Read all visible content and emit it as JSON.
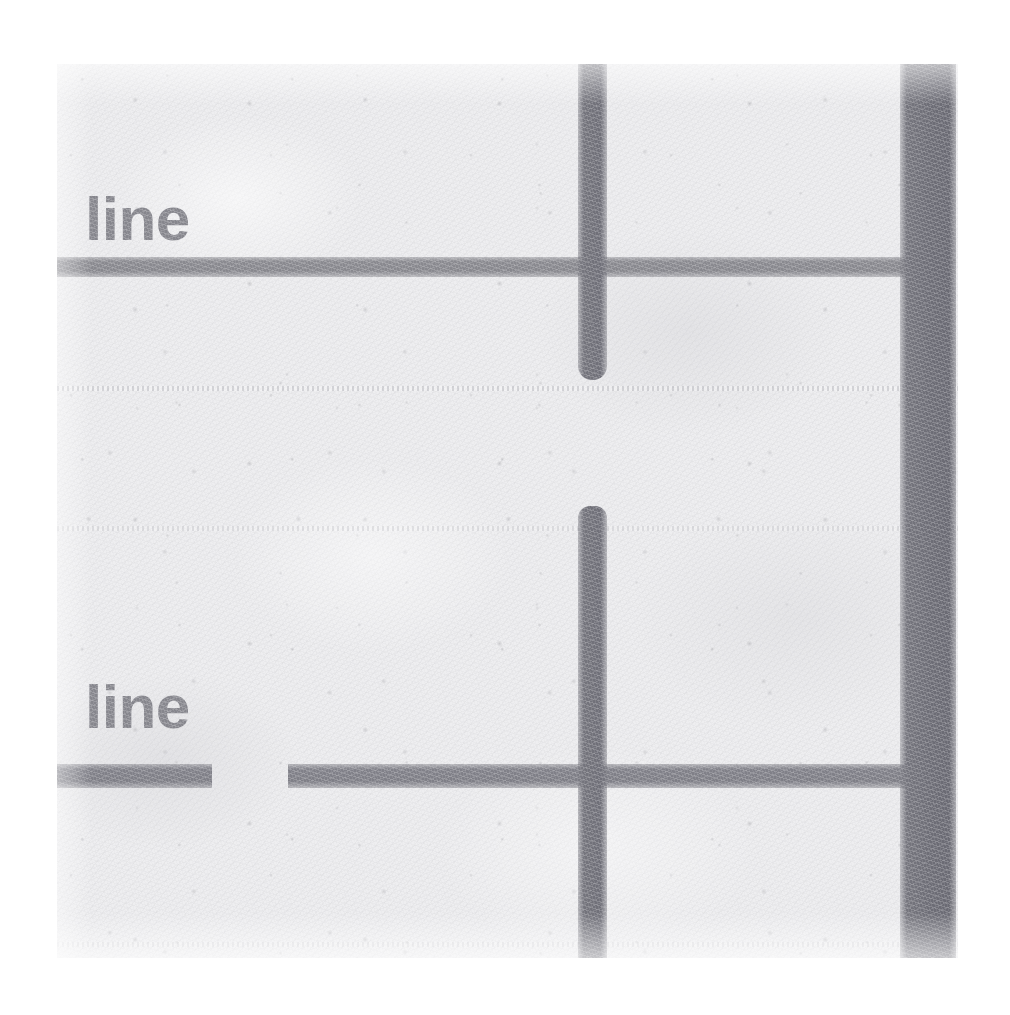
{
  "image": {
    "kind": "scanned-fabric-swatch",
    "background_color": "#ffffff",
    "sheet_color": "#eeeef0",
    "ink_color": "#86868d"
  },
  "labels": {
    "top": "line",
    "bottom": "line"
  },
  "marks": {
    "horizontal_rule_top": "horizontal rule",
    "horizontal_rule_bottom_left": "horizontal rule segment",
    "horizontal_rule_bottom_right": "horizontal rule segment",
    "vertical_rule_upper": "vertical rule",
    "vertical_rule_lower": "vertical rule",
    "vertical_rule_right_edge": "thick vertical band",
    "seam_upper": "stitched seam",
    "seam_middle": "stitched seam",
    "seam_lower": "stitched seam"
  }
}
